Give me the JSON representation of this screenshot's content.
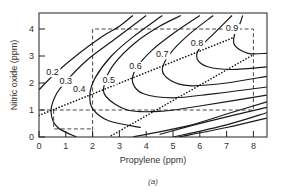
{
  "chart_data": {
    "type": "line",
    "subtype": "contour",
    "title": "",
    "caption": "(a)",
    "xlabel": "Propylene (ppm)",
    "ylabel": "Nitric oxide (ppm)",
    "xlim": [
      0,
      8.5
    ],
    "ylim": [
      0,
      4.5
    ],
    "xticks": [
      "0",
      "1",
      "2",
      "3",
      "4",
      "5",
      "6",
      "7",
      "8"
    ],
    "yticks": [
      "0",
      "1",
      "2",
      "3",
      "4"
    ],
    "grid": false,
    "contour_levels": [
      "0.2",
      "0.3",
      "0.4",
      "0.5",
      "0.6",
      "0.7",
      "0.8",
      "0.9"
    ],
    "contours": [
      {
        "level": "0.2",
        "points": [
          [
            0,
            1.75
          ],
          [
            0.6,
            2.35
          ],
          [
            1.5,
            3.1
          ],
          [
            2.4,
            3.75
          ],
          [
            3.0,
            4.1
          ],
          [
            3.5,
            4.5
          ]
        ]
      },
      {
        "level": "0.3",
        "points": [
          [
            1.4,
            0
          ],
          [
            0.7,
            0.35
          ],
          [
            0.45,
            0.9
          ],
          [
            0.6,
            1.5
          ],
          [
            1.0,
            2.05
          ],
          [
            1.8,
            2.85
          ],
          [
            2.8,
            3.6
          ],
          [
            4.0,
            4.5
          ]
        ]
      },
      {
        "level": "0.4",
        "points": [
          [
            3.8,
            0.35
          ],
          [
            2.6,
            0.6
          ],
          [
            2.0,
            1.05
          ],
          [
            1.9,
            1.6
          ],
          [
            2.1,
            2.2
          ],
          [
            2.7,
            3.0
          ],
          [
            3.5,
            3.7
          ],
          [
            4.6,
            4.5
          ]
        ]
      },
      {
        "level": "0.5",
        "points": [
          [
            8.5,
            1.55
          ],
          [
            6.0,
            1.15
          ],
          [
            4.5,
            0.95
          ],
          [
            3.3,
            1.0
          ],
          [
            2.5,
            1.5
          ],
          [
            2.45,
            2.0
          ],
          [
            2.8,
            2.7
          ],
          [
            3.6,
            3.5
          ],
          [
            4.5,
            4.1
          ],
          [
            5.3,
            4.5
          ]
        ]
      },
      {
        "level": "0.6",
        "points": [
          [
            8.5,
            1.85
          ],
          [
            6.5,
            1.6
          ],
          [
            5.0,
            1.45
          ],
          [
            3.9,
            1.6
          ],
          [
            3.5,
            2.0
          ],
          [
            3.6,
            2.5
          ],
          [
            4.2,
            3.2
          ],
          [
            5.1,
            3.9
          ],
          [
            6.0,
            4.5
          ]
        ]
      },
      {
        "level": "0.7",
        "points": [
          [
            8.5,
            2.25
          ],
          [
            7.0,
            2.0
          ],
          [
            5.6,
            1.9
          ],
          [
            4.9,
            2.1
          ],
          [
            4.6,
            2.5
          ],
          [
            4.9,
            3.1
          ],
          [
            5.6,
            3.8
          ],
          [
            6.5,
            4.5
          ]
        ]
      },
      {
        "level": "0.8",
        "points": [
          [
            8.5,
            2.6
          ],
          [
            7.2,
            2.5
          ],
          [
            6.3,
            2.6
          ],
          [
            5.9,
            2.9
          ],
          [
            6.0,
            3.3
          ],
          [
            6.6,
            3.9
          ],
          [
            7.2,
            4.5
          ]
        ]
      },
      {
        "level": "0.9",
        "points": [
          [
            8.5,
            3.1
          ],
          [
            7.8,
            3.1
          ],
          [
            7.3,
            3.4
          ],
          [
            7.3,
            3.8
          ],
          [
            7.5,
            4.2
          ],
          [
            7.6,
            4.5
          ]
        ]
      },
      {
        "level": "",
        "points": [
          [
            3.5,
            0
          ],
          [
            5.5,
            0.4
          ],
          [
            7.0,
            0.85
          ],
          [
            8.5,
            1.3
          ]
        ]
      },
      {
        "level": "",
        "points": [
          [
            4.5,
            0.1
          ],
          [
            6.2,
            0.55
          ],
          [
            8.5,
            1.1
          ]
        ]
      },
      {
        "level": "",
        "points": [
          [
            5.0,
            0
          ],
          [
            7.0,
            0.45
          ],
          [
            8.5,
            0.9
          ]
        ]
      },
      {
        "level": "",
        "points": [
          [
            5.2,
            0
          ],
          [
            7.0,
            0.35
          ],
          [
            8.5,
            0.7
          ]
        ]
      }
    ],
    "dashed_regions": [
      {
        "name": "outer-rectangle",
        "points": [
          [
            2,
            0
          ],
          [
            2,
            4
          ],
          [
            8,
            4
          ],
          [
            8,
            1
          ],
          [
            0,
            1
          ]
        ]
      },
      {
        "name": "inner-rectangle",
        "points": [
          [
            0.55,
            1
          ],
          [
            0.55,
            0.3
          ],
          [
            2,
            0.3
          ]
        ]
      }
    ],
    "dotted_lines": [
      {
        "name": "upper-ridge",
        "from": [
          0,
          0.8
        ],
        "to": [
          7.3,
          3.7
        ]
      },
      {
        "name": "lower-ridge",
        "from": [
          2.7,
          0.05
        ],
        "to": [
          8,
          3.05
        ]
      }
    ],
    "label_positions": {
      "0.2": [
        0.5,
        2.4
      ],
      "0.3": [
        1.0,
        2.05
      ],
      "0.4": [
        1.5,
        1.75
      ],
      "0.5": [
        2.6,
        2.1
      ],
      "0.6": [
        3.6,
        2.6
      ],
      "0.7": [
        4.6,
        3.05
      ],
      "0.8": [
        5.9,
        3.45
      ],
      "0.9": [
        7.2,
        4.0
      ]
    }
  }
}
